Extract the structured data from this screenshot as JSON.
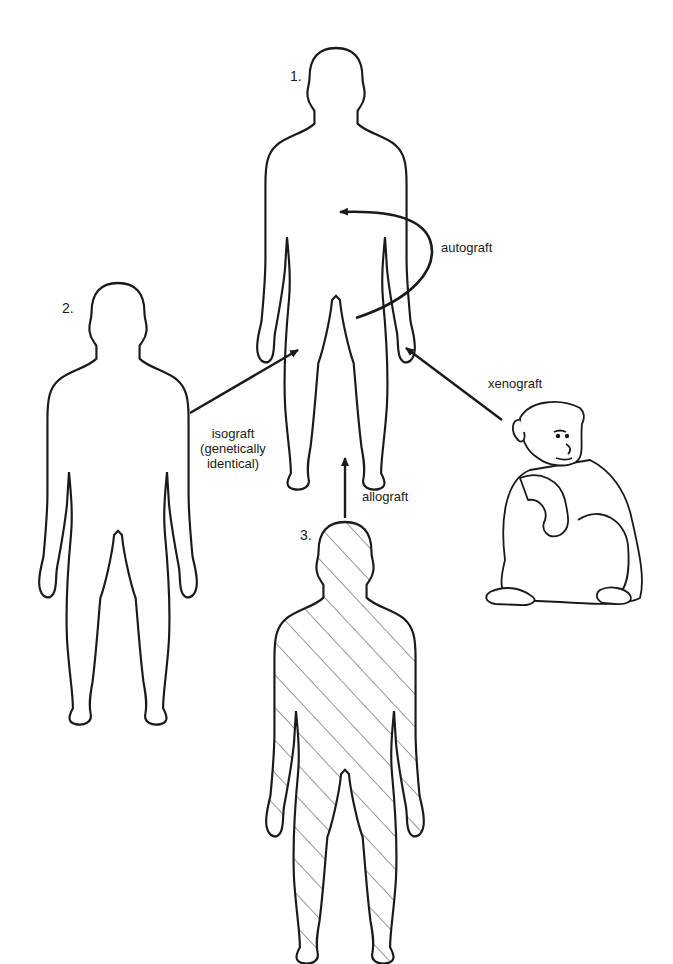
{
  "figure": {
    "figures": [
      {
        "id": "recipient",
        "number": "1."
      },
      {
        "id": "identical_twin",
        "number": "2."
      },
      {
        "id": "other_human",
        "number": "3."
      }
    ],
    "labels": {
      "autograft": "autograft",
      "isograft": "isograft",
      "isograft_note_1": "(genetically",
      "isograft_note_2": "identical)",
      "allograft": "allograft",
      "xenograft": "xenograft"
    },
    "colors": {
      "line": "#1a1a1a",
      "background": "#ffffff"
    }
  }
}
